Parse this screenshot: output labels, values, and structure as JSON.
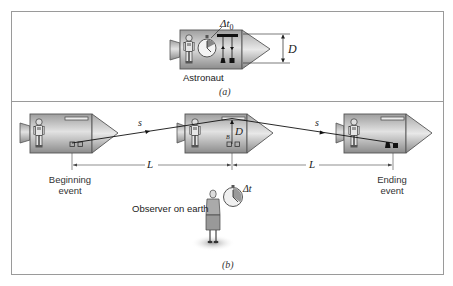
{
  "figure": {
    "panel_a": {
      "caption": "(a)",
      "astronaut_label": "Astronaut",
      "clock_label_main": "Δt",
      "clock_label_sub": "0",
      "distance_label": "D"
    },
    "panel_b": {
      "caption": "(b)",
      "path_label_1": "s",
      "path_label_2": "s",
      "distance_label": "D",
      "length_label_1": "L",
      "length_label_2": "L",
      "beginning_event_line1": "Beginning",
      "beginning_event_line2": "event",
      "ending_event_line1": "Ending",
      "ending_event_line2": "event",
      "observer_label": "Observer on earth",
      "observer_clock_label": "Δt"
    },
    "colors": {
      "frame": "#9a9a9a",
      "ship_body": "#c8c8c8",
      "ship_outline": "#555555",
      "light_path": "#111111"
    }
  }
}
